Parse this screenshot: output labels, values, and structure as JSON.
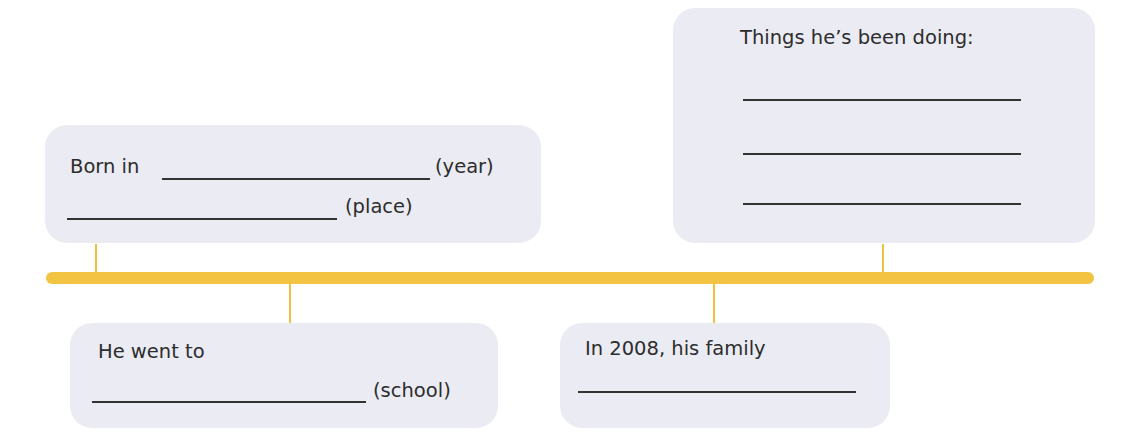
{
  "timeline": {
    "color": "#f3c443",
    "box_color": "#ebebf3"
  },
  "boxes": {
    "born": {
      "prefix": "Born in",
      "year_label": "(year)",
      "place_label": "(place)"
    },
    "doing": {
      "title": "Things he’s been doing:"
    },
    "school": {
      "prefix": "He went to",
      "school_label": "(school)"
    },
    "family": {
      "prefix": "In 2008, his family"
    }
  }
}
